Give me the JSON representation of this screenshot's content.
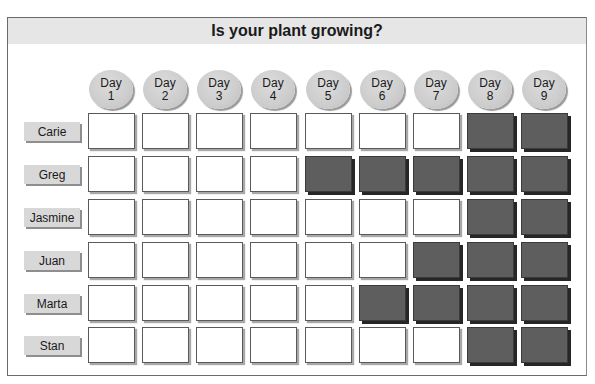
{
  "title": "Is your plant growing?",
  "days": [
    {
      "label": "Day",
      "num": "1"
    },
    {
      "label": "Day",
      "num": "2"
    },
    {
      "label": "Day",
      "num": "3"
    },
    {
      "label": "Day",
      "num": "4"
    },
    {
      "label": "Day",
      "num": "5"
    },
    {
      "label": "Day",
      "num": "6"
    },
    {
      "label": "Day",
      "num": "7"
    },
    {
      "label": "Day",
      "num": "8"
    },
    {
      "label": "Day",
      "num": "9"
    }
  ],
  "rows": [
    {
      "name": "Carie",
      "grown": [
        0,
        0,
        0,
        0,
        0,
        0,
        0,
        1,
        1
      ]
    },
    {
      "name": "Greg",
      "grown": [
        0,
        0,
        0,
        0,
        1,
        1,
        1,
        1,
        1
      ]
    },
    {
      "name": "Jasmine",
      "grown": [
        0,
        0,
        0,
        0,
        0,
        0,
        0,
        1,
        1
      ]
    },
    {
      "name": "Juan",
      "grown": [
        0,
        0,
        0,
        0,
        0,
        0,
        1,
        1,
        1
      ]
    },
    {
      "name": "Marta",
      "grown": [
        0,
        0,
        0,
        0,
        0,
        1,
        1,
        1,
        1
      ]
    },
    {
      "name": "Stan",
      "grown": [
        0,
        0,
        0,
        0,
        0,
        0,
        0,
        1,
        1
      ]
    }
  ],
  "colors": {
    "grown": "#5e5e5e",
    "not_grown": "#ffffff",
    "header_band": "#e6e6e6",
    "day_badge": "#cdcdcd"
  }
}
